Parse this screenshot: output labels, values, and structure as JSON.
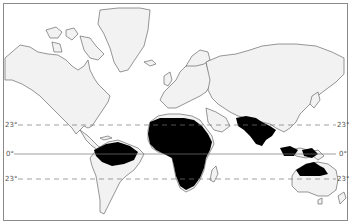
{
  "map": {
    "type": "world-map",
    "projection": "mercator-style",
    "style": "black-and-white outline",
    "land_fill": "#f2f2f2",
    "coast_stroke": "#6a6a6a",
    "highlight_fill": "#000000",
    "highlighted_regions": [
      {
        "name": "Amazon basin (South America)"
      },
      {
        "name": "Central Africa"
      },
      {
        "name": "South / Southeast Asia"
      },
      {
        "name": "Indonesia / New Guinea"
      },
      {
        "name": "Northern Australia"
      }
    ],
    "reference_lines": [
      {
        "name": "tropic-of-cancer",
        "style": "dashed",
        "label_left": "23°",
        "label_right": "23°"
      },
      {
        "name": "equator",
        "style": "solid",
        "label_left": "0°",
        "label_right": "0°"
      },
      {
        "name": "tropic-of-capricorn",
        "style": "dashed",
        "label_left": "23°",
        "label_right": "23°"
      }
    ]
  }
}
